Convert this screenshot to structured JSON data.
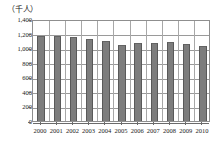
{
  "chart_data": {
    "type": "bar",
    "title": "",
    "subtitle": "",
    "unit_label": "（千人）",
    "xlabel": "",
    "ylabel": "",
    "ylim": [
      0,
      1400
    ],
    "yticks": [
      "0",
      "200",
      "400",
      "600",
      "800",
      "1,000",
      "1,200",
      "1,400"
    ],
    "ytick_values": [
      0,
      200,
      400,
      600,
      800,
      1000,
      1200,
      1400
    ],
    "grid": true,
    "legend": false,
    "legend_position": "none",
    "bar_color": "#7d7d7d",
    "bar_edge_color": "#595959",
    "axis_color": "#8f8f8f",
    "grid_color": "#9a9a9a",
    "categories": [
      "2000",
      "2001",
      "2002",
      "2003",
      "2004",
      "2005",
      "2006",
      "2007",
      "2008",
      "2009",
      "2010"
    ],
    "values": [
      1165,
      1165,
      1155,
      1120,
      1105,
      1050,
      1070,
      1075,
      1080,
      1060,
      1030
    ],
    "series": [
      {
        "name": "",
        "values": [
          1165,
          1165,
          1155,
          1120,
          1105,
          1050,
          1070,
          1075,
          1080,
          1060,
          1030
        ]
      }
    ]
  }
}
